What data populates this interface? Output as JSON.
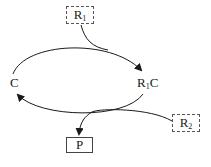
{
  "diagram": {
    "type": "catalytic-cycle",
    "nodes": {
      "catalyst": {
        "label": "C"
      },
      "complex": {
        "label_main": "R",
        "label_sub": "1",
        "label_tail": "C"
      },
      "reactant1": {
        "label_main": "R",
        "label_sub": "1",
        "style": "dashed-box"
      },
      "reactant2": {
        "label_main": "R",
        "label_sub": "2",
        "style": "dashed-box"
      },
      "product": {
        "label": "P",
        "style": "solid-box"
      }
    },
    "edges": [
      {
        "from": "C",
        "to": "R1C",
        "via": "top-arc",
        "input": "R1"
      },
      {
        "from": "R1C",
        "to": "C",
        "via": "bottom-arc",
        "input": "R2",
        "output": "P"
      }
    ],
    "colors": {
      "stroke": "#1a1a1a",
      "background": "#ffffff"
    }
  }
}
